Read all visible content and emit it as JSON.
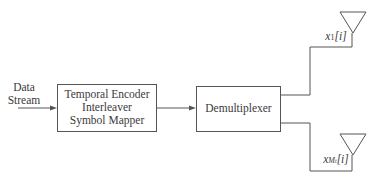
{
  "diagram": {
    "input_label_line1": "Data",
    "input_label_line2": "Stream",
    "encoder_block": {
      "line1": "Temporal Encoder",
      "line2": "Interleaver",
      "line3": "Symbol Mapper"
    },
    "demux_block": {
      "label": "Demultiplexer"
    },
    "outputs": [
      {
        "var": "x",
        "sub": "1",
        "idx": "[i]"
      },
      {
        "var": "x",
        "sub": "M",
        "subsub": "t",
        "idx": "[i]"
      }
    ],
    "colors": {
      "stroke": "#555555",
      "text": "#3a3a3a"
    }
  }
}
